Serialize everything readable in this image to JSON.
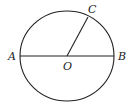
{
  "diagram": {
    "type": "circle-geometry",
    "colors": {
      "stroke": "#222222",
      "background": "#ffffff"
    },
    "circle": {
      "cx": 67,
      "cy": 56,
      "rx": 47,
      "ry": 45,
      "center_label": "O"
    },
    "points": [
      {
        "id": "A",
        "label": "A",
        "x": 20,
        "y": 56,
        "label_x": 8,
        "label_y": 60
      },
      {
        "id": "B",
        "label": "B",
        "x": 114,
        "y": 56,
        "label_x": 118,
        "label_y": 60
      },
      {
        "id": "C",
        "label": "C",
        "x": 88,
        "y": 17,
        "label_x": 88,
        "label_y": 13
      },
      {
        "id": "O",
        "label": "O",
        "x": 67,
        "y": 56,
        "label_x": 63,
        "label_y": 70
      }
    ],
    "segments": [
      {
        "id": "AB",
        "from": "A",
        "to": "B",
        "kind": "diameter"
      },
      {
        "id": "OC",
        "from": "O",
        "to": "C",
        "kind": "radius"
      }
    ]
  }
}
